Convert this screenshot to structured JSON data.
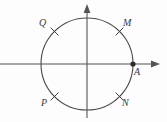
{
  "figure": {
    "type": "geometry-diagram",
    "background_color": "#fdfdfd",
    "stroke_color": "#4a4a4a",
    "axis_color": "#555555",
    "label_color": "#3a3a3a",
    "width": 167,
    "height": 122
  },
  "axes": {
    "x_axis": {
      "name": "x-axis",
      "y": 64,
      "x_start": 0,
      "x_end": 160,
      "arrow_right": true,
      "arrow_left": false
    },
    "y_axis": {
      "name": "y-axis",
      "x": 87,
      "y_start": 4,
      "y_end": 118,
      "arrow_up": true,
      "arrow_down": false
    },
    "origin": {
      "x": 87,
      "y": 64
    }
  },
  "circle": {
    "center_x": 87,
    "center_y": 64,
    "radius": 46
  },
  "points": [
    {
      "id": "Q",
      "label": "Q",
      "marker": "cross",
      "angle_deg": 135,
      "marker_x": 54.5,
      "marker_y": 31.5,
      "label_x": 39,
      "label_y": 18
    },
    {
      "id": "M",
      "label": "M",
      "marker": "cross",
      "angle_deg": 45,
      "marker_x": 119.5,
      "marker_y": 31.5,
      "label_x": 123,
      "label_y": 18
    },
    {
      "id": "P",
      "label": "P",
      "marker": "cross",
      "angle_deg": 225,
      "marker_x": 54.5,
      "marker_y": 96.5,
      "label_x": 41,
      "label_y": 98
    },
    {
      "id": "N",
      "label": "N",
      "marker": "cross",
      "angle_deg": 315,
      "marker_x": 119.5,
      "marker_y": 96.5,
      "label_x": 122,
      "label_y": 98
    },
    {
      "id": "A",
      "label": "A",
      "marker": "filled-dot",
      "angle_deg": 0,
      "marker_x": 133,
      "marker_y": 64,
      "label_x": 134,
      "label_y": 67
    }
  ]
}
